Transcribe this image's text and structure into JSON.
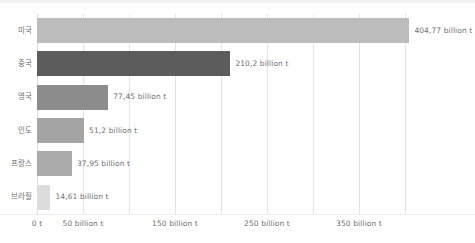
{
  "chart_data": {
    "type": "bar",
    "orientation": "horizontal",
    "title": "",
    "subtitle": "",
    "xlabel": "",
    "ylabel": "",
    "grid": true,
    "legend": null,
    "xlim": [
      0,
      425
    ],
    "categories": [
      "미국",
      "중국",
      "영국",
      "인도",
      "프랑스",
      "브라질"
    ],
    "values": [
      404.77,
      210.2,
      77.45,
      51.2,
      37.95,
      14.61
    ],
    "value_labels": [
      "404,77 billion t",
      "210,2 billion t",
      "77,45 billion t",
      "51,2 billion t",
      "37,95 billion t",
      "14,61 billion t"
    ],
    "bar_colors": [
      "#bcbcbc",
      "#5c5c5c",
      "#8c8c8c",
      "#a4a4a4",
      "#aaaaaa",
      "#dcdcdc"
    ],
    "xticks": [
      0,
      50,
      150,
      250,
      350
    ],
    "xtick_labels": [
      "0 t",
      "50 billion t",
      "150 billion t",
      "250 billion t",
      "350 billion t"
    ],
    "gridline_values": [
      0,
      50,
      100,
      150,
      200,
      250,
      300,
      350,
      400
    ],
    "axis_color": "#e4e4e4",
    "text_color": "#6f6f6f",
    "background": "#ffffff"
  }
}
